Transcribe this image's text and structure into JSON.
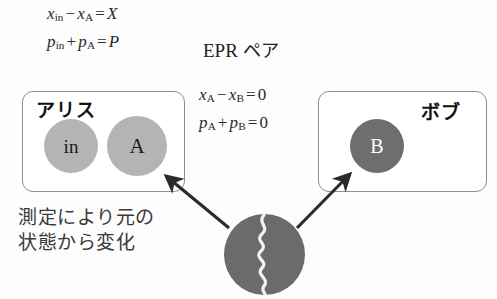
{
  "diagram": {
    "colors": {
      "box_border": "#8e8e8e",
      "particle_light": "#b4b4b4",
      "particle_dark": "#6e6e6e",
      "source_fill": "#6b6b6b",
      "arrow": "#2b2b2b",
      "text": "#222222",
      "caption_text": "#3a3a3a",
      "background": "#fdfdfd"
    },
    "equations": {
      "top": [
        {
          "id": "eq-top-1",
          "text": "x_in - x_A = X",
          "lhs_var_1": "x",
          "lhs_sub_1": "in",
          "operator_1": "−",
          "lhs_var_2": "x",
          "lhs_sub_2": "A",
          "equals": "=",
          "rhs": "X"
        },
        {
          "id": "eq-top-2",
          "text": "p_in + p_A = P",
          "lhs_var_1": "p",
          "lhs_sub_1": "in",
          "operator_1": "+",
          "lhs_var_2": "p",
          "lhs_sub_2": "A",
          "equals": "=",
          "rhs": "P"
        }
      ],
      "middle": [
        {
          "id": "eq-mid-1",
          "text": "x_A - x_B = 0",
          "lhs_var_1": "x",
          "lhs_sub_1": "A",
          "operator_1": "−",
          "lhs_var_2": "x",
          "lhs_sub_2": "B",
          "equals": "=",
          "rhs": "0"
        },
        {
          "id": "eq-mid-2",
          "text": "p_A + p_B = 0",
          "lhs_var_1": "p",
          "lhs_sub_1": "A",
          "operator_1": "+",
          "lhs_var_2": "p",
          "lhs_sub_2": "B",
          "equals": "=",
          "rhs": "0"
        }
      ]
    },
    "epr_label": {
      "latin": "EPR",
      "kana": "ペア"
    },
    "alice": {
      "label": "アリス",
      "particles": [
        {
          "id": "in",
          "label": "in",
          "shade": "light"
        },
        {
          "id": "A",
          "label": "A",
          "shade": "light"
        }
      ]
    },
    "bob": {
      "label": "ボブ",
      "particles": [
        {
          "id": "B",
          "label": "B",
          "shade": "dark"
        }
      ]
    },
    "source": {
      "name": "epr-source",
      "glyph": "squiggle-wave"
    },
    "caption": {
      "line1": "測定により元の",
      "line2": "状態から変化"
    },
    "arrows": [
      {
        "name": "arrow-to-alice",
        "from": "epr-source",
        "to": "particle-a",
        "direction": "up-left"
      },
      {
        "name": "arrow-to-bob",
        "from": "epr-source",
        "to": "particle-b",
        "direction": "up-right"
      }
    ]
  }
}
